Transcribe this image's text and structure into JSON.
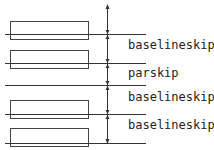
{
  "diagram": {
    "labels": [
      {
        "text": "baselineskip",
        "y": 49
      },
      {
        "text": "parskip",
        "y": 77
      },
      {
        "text": "baselineskip",
        "y": 101
      },
      {
        "text": "baselineskip",
        "y": 129
      }
    ],
    "boxes": [
      {
        "y": 21,
        "h": 18
      },
      {
        "y": 50,
        "h": 18
      },
      {
        "y": 100,
        "h": 18
      },
      {
        "y": 128,
        "h": 18
      }
    ],
    "baselines": [
      34,
      63,
      85,
      114,
      143
    ],
    "colors": {
      "line": "#333333",
      "box": "#444444",
      "text": "#222222"
    }
  }
}
